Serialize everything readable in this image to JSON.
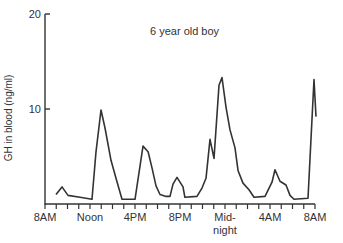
{
  "chart_data": {
    "type": "line",
    "title": "6 year old boy",
    "xlabel": "",
    "ylabel": "GH in blood (ng/ml)",
    "ylim": [
      0,
      20
    ],
    "xlim_hours_from_8AM": [
      0,
      24
    ],
    "grid": false,
    "legend": null,
    "y_ticks": [
      {
        "value": 20,
        "label": "20"
      },
      {
        "value": 10,
        "label": "10"
      }
    ],
    "x_ticks_hourly": 24,
    "x_tick_labels": [
      {
        "hour": 0,
        "label": "8AM"
      },
      {
        "hour": 4,
        "label": "Noon"
      },
      {
        "hour": 8,
        "label": "4PM"
      },
      {
        "hour": 12,
        "label": "8PM"
      },
      {
        "hour": 16,
        "label": "Mid-",
        "label2": "night"
      },
      {
        "hour": 20,
        "label": "4AM"
      },
      {
        "hour": 24,
        "label": "8AM"
      }
    ],
    "series": [
      {
        "name": "GH",
        "color": "#333333",
        "points": [
          [
            0.98,
            1.0
          ],
          [
            1.51,
            1.8
          ],
          [
            2.04,
            0.9
          ],
          [
            3.11,
            0.7
          ],
          [
            4.18,
            0.5
          ],
          [
            4.53,
            5.5
          ],
          [
            4.98,
            9.9
          ],
          [
            5.33,
            8.0
          ],
          [
            5.87,
            4.6
          ],
          [
            6.31,
            2.7
          ],
          [
            6.84,
            0.5
          ],
          [
            8.0,
            0.5
          ],
          [
            8.71,
            6.1
          ],
          [
            9.16,
            5.5
          ],
          [
            9.51,
            3.8
          ],
          [
            9.87,
            1.9
          ],
          [
            10.22,
            1.0
          ],
          [
            10.76,
            0.8
          ],
          [
            11.11,
            0.8
          ],
          [
            11.38,
            2.1
          ],
          [
            11.73,
            2.8
          ],
          [
            12.27,
            1.8
          ],
          [
            12.44,
            0.7
          ],
          [
            13.51,
            0.8
          ],
          [
            13.96,
            1.7
          ],
          [
            14.31,
            2.7
          ],
          [
            14.67,
            6.8
          ],
          [
            15.02,
            4.8
          ],
          [
            15.47,
            12.5
          ],
          [
            15.73,
            13.3
          ],
          [
            16.09,
            10.2
          ],
          [
            16.44,
            7.8
          ],
          [
            16.89,
            5.9
          ],
          [
            17.16,
            3.5
          ],
          [
            17.6,
            2.2
          ],
          [
            18.13,
            1.5
          ],
          [
            18.58,
            0.7
          ],
          [
            19.56,
            0.8
          ],
          [
            20.18,
            2.3
          ],
          [
            20.44,
            3.6
          ],
          [
            20.89,
            2.4
          ],
          [
            21.42,
            2.0
          ],
          [
            21.78,
            0.9
          ],
          [
            22.13,
            0.5
          ],
          [
            23.38,
            0.6
          ],
          [
            23.91,
            13.1
          ],
          [
            24.09,
            9.2
          ]
        ]
      }
    ]
  },
  "layout": {
    "x0_px": 45,
    "x1_px": 315,
    "y0_px": 204,
    "y20_px": 14,
    "axis_color": "#333333"
  }
}
